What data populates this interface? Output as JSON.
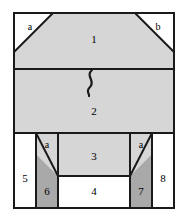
{
  "figure": {
    "title": "",
    "canvas": {
      "width": 188,
      "height": 223
    },
    "colors": {
      "background": "#ffffff",
      "light_gray": "#d6d6d6",
      "dark_gray": "#a9a9a9",
      "white_fill": "#ffffff",
      "stroke": "#1a1a1a"
    },
    "frame": {
      "left": 14,
      "top": 13,
      "right": 174,
      "bottom": 208
    },
    "dividers": {
      "region1_region2_y": 69,
      "region2_bottom_y": 133,
      "region3_region4_y": 176
    },
    "regions": [
      {
        "id": "region-1",
        "label": "1",
        "fill": "light_gray",
        "label_x": 94,
        "label_y": 40,
        "shape": "trapezoid-top"
      },
      {
        "id": "region-2",
        "label": "2",
        "fill": "light_gray",
        "label_x": 94,
        "label_y": 112,
        "shape": "rectangle"
      },
      {
        "id": "region-3",
        "label": "3",
        "fill": "light_gray",
        "label_x": 94,
        "label_y": 157,
        "shape": "rectangle"
      },
      {
        "id": "region-4",
        "label": "4",
        "fill": "white_fill",
        "label_x": 94,
        "label_y": 192,
        "shape": "rectangle"
      },
      {
        "id": "region-5",
        "label": "5",
        "fill": "white_fill",
        "label_x": 25,
        "label_y": 179,
        "shape": "rectangle"
      },
      {
        "id": "region-6",
        "label": "6",
        "fill": "dark_gray",
        "label_x": 47,
        "label_y": 192,
        "shape": "diagonal-top"
      },
      {
        "id": "region-7",
        "label": "7",
        "fill": "dark_gray",
        "label_x": 141,
        "label_y": 192,
        "shape": "diagonal-top"
      },
      {
        "id": "region-8",
        "label": "8",
        "fill": "white_fill",
        "label_x": 163,
        "label_y": 179,
        "shape": "rectangle"
      }
    ],
    "corner_labels": [
      {
        "id": "corner-a-top-left",
        "label": "a",
        "x": 30,
        "y": 28
      },
      {
        "id": "corner-b-top-right",
        "label": "b",
        "x": 158,
        "y": 28
      },
      {
        "id": "corner-a-bottom-left",
        "label": "a",
        "x": 47,
        "y": 146
      },
      {
        "id": "corner-a-bottom-right",
        "label": "a",
        "x": 141,
        "y": 146
      }
    ],
    "squiggle": {
      "id": "break-squiggle",
      "description": "s-curve break mark",
      "x": 90,
      "y_top": 70,
      "y_bottom": 96
    }
  }
}
